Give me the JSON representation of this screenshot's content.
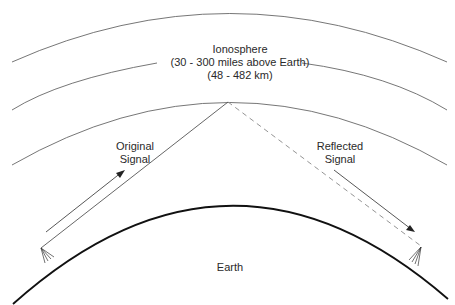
{
  "diagram": {
    "ionosphere": {
      "title": "Ionosphere",
      "range_miles": "(30 - 300 miles above Earth)",
      "range_km": "(48 - 482 km)"
    },
    "original_signal": {
      "line1": "Original",
      "line2": "Signal"
    },
    "reflected_signal": {
      "line1": "Reflected",
      "line2": "Signal"
    },
    "earth": {
      "label": "Earth"
    },
    "colors": {
      "lines": "#555555",
      "earth": "#111111",
      "text": "#2a2a2a"
    }
  }
}
